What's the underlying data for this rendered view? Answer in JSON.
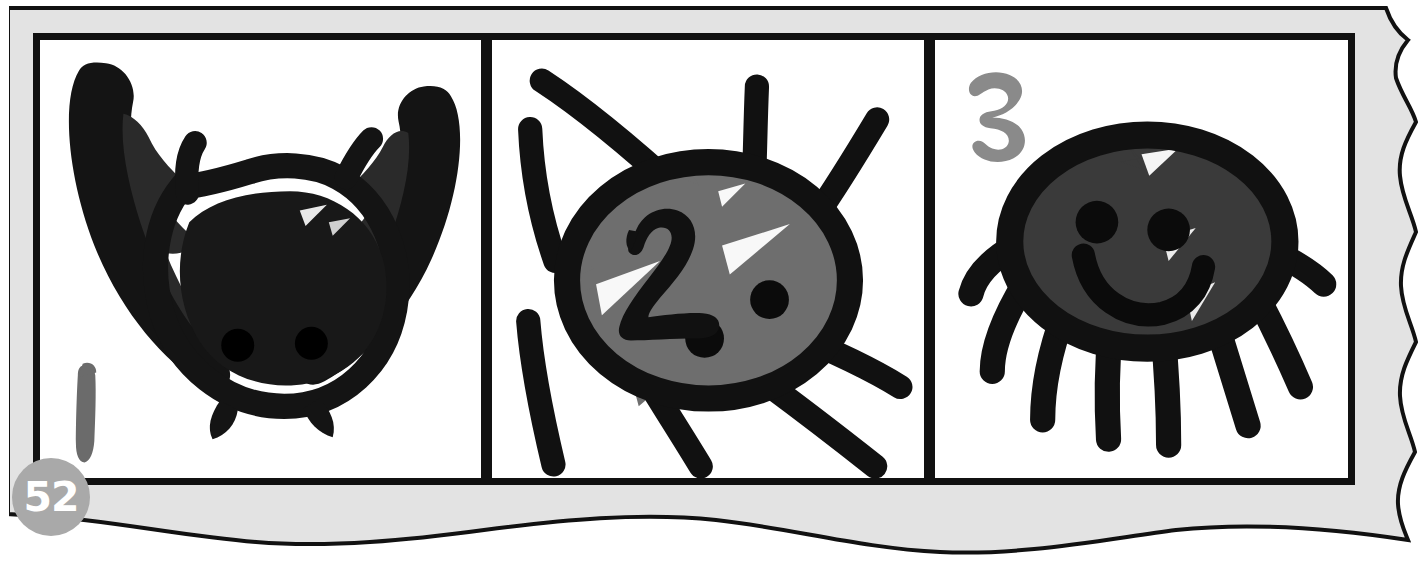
{
  "page": {
    "number": "52",
    "badge_color": "#a9a9a9",
    "badge_text_color": "#ffffff",
    "sheet_color": "#e3e3e3",
    "sheet_outline_color": "#111111",
    "background_color": "#ffffff",
    "panel_border_color": "#111111",
    "panel_background_color": "#ffffff"
  },
  "panels": [
    {
      "id": "panel-1",
      "name": "panel-one-bat-creature",
      "step_label": "1",
      "step_label_color": "#6b6b6b",
      "creature_name": "bat-creature",
      "body_color": "#141414",
      "outline_color": "#111111",
      "eye_color": "#111111",
      "description": "Bat-like creature with two large pointed wings, round dark body, two eye dots and small feet"
    },
    {
      "id": "panel-2",
      "name": "panel-two-spider-creature",
      "step_label": "2",
      "step_label_color": "#111111",
      "creature_name": "spider-creature",
      "body_color": "#6e6e6e",
      "outline_color": "#111111",
      "eye_color": "#111111",
      "leg_count": "8",
      "description": "Round spider with grey oval body, thick black outline, two eye dots and eight radiating legs"
    },
    {
      "id": "panel-3",
      "name": "panel-three-smiling-creature",
      "step_label": "3",
      "step_label_color": "#8a8a8a",
      "creature_name": "smiling-creature",
      "body_color": "#3a3a3a",
      "outline_color": "#111111",
      "eye_color": "#111111",
      "smile_color": "#111111",
      "leg_count": "9",
      "description": "Smiling round creature with dark grey oval body, two eyes, a curved smile and nine legs hanging below"
    }
  ]
}
